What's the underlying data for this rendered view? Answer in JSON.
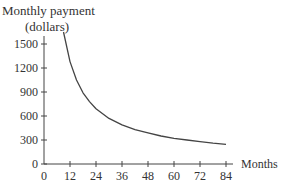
{
  "chart_data": {
    "type": "line",
    "title": "",
    "ylabel": "Monthly payment",
    "ylabel_unit": "(dollars)",
    "xlabel": "Months",
    "x_ticks": [
      0,
      12,
      24,
      36,
      48,
      60,
      72,
      84
    ],
    "y_ticks": [
      0,
      300,
      600,
      900,
      1200,
      1500
    ],
    "xlim": [
      0,
      86
    ],
    "ylim": [
      0,
      1650
    ],
    "grid": false,
    "legend": null,
    "series": [
      {
        "name": "Monthly payment",
        "x": [
          9,
          12,
          15,
          18,
          21,
          24,
          30,
          36,
          42,
          48,
          54,
          60,
          66,
          72,
          78,
          84
        ],
        "y": [
          1650,
          1280,
          1050,
          890,
          780,
          690,
          570,
          490,
          430,
          390,
          350,
          320,
          300,
          280,
          260,
          245
        ]
      }
    ]
  }
}
